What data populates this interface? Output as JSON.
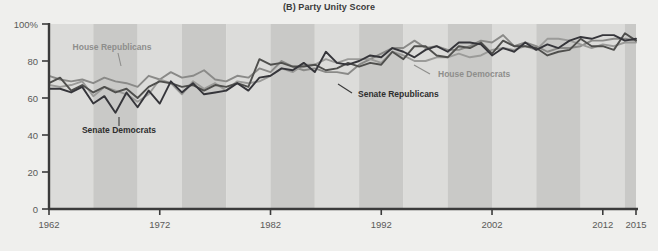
{
  "chart": {
    "title": "(B) Party Unity Score",
    "background_color": "#efefed",
    "band_color_light": "#dcdcda",
    "band_color_dark": "#c9c9c7",
    "axis_color": "#3b3b3b"
  },
  "axes": {
    "y_ticks": [
      "100%",
      "80",
      "60",
      "40",
      "20",
      "0"
    ],
    "y_values": [
      100,
      80,
      60,
      40,
      20,
      0
    ],
    "x_ticks": [
      "1962",
      "1972",
      "1982",
      "1992",
      "2002",
      "2012",
      "2015"
    ],
    "x_values": [
      1962,
      1972,
      1982,
      1992,
      2002,
      2012,
      2015
    ]
  },
  "annotations": [
    {
      "id": "house-republicans",
      "text": "House Republicans",
      "style": "light",
      "x": 112,
      "y": 50,
      "anchor": "middle",
      "leader": {
        "x1": 118,
        "y1": 53,
        "x2": 121,
        "y2": 66
      }
    },
    {
      "id": "senate-democrats",
      "text": "Senate Democrats",
      "style": "dark",
      "x": 119,
      "y": 133,
      "anchor": "middle",
      "leader": {
        "x1": 119,
        "y1": 117,
        "x2": 119,
        "y2": 126
      }
    },
    {
      "id": "house-democrats",
      "text": "House Democrats",
      "style": "light",
      "x": 438,
      "y": 77,
      "anchor": "start",
      "leader": {
        "x1": 430,
        "y1": 74,
        "x2": 414,
        "y2": 65
      }
    },
    {
      "id": "senate-republicans",
      "text": "Senate Republicans",
      "style": "dark",
      "x": 358,
      "y": 97,
      "anchor": "start",
      "leader": {
        "x1": 352,
        "y1": 93,
        "x2": 338,
        "y2": 84
      }
    }
  ],
  "chart_data": {
    "type": "line",
    "title": "(B) Party Unity Score",
    "xlabel": "",
    "ylabel": "",
    "xlim": [
      1962,
      2015
    ],
    "ylim": [
      0,
      100
    ],
    "grid": false,
    "legend": "inline-annotations",
    "x": [
      1962,
      1963,
      1964,
      1965,
      1966,
      1967,
      1968,
      1969,
      1970,
      1971,
      1972,
      1973,
      1974,
      1975,
      1976,
      1977,
      1978,
      1979,
      1980,
      1981,
      1982,
      1983,
      1984,
      1985,
      1986,
      1987,
      1988,
      1989,
      1990,
      1991,
      1992,
      1993,
      1994,
      1995,
      1996,
      1997,
      1998,
      1999,
      2000,
      2001,
      2002,
      2003,
      2004,
      2005,
      2006,
      2007,
      2008,
      2009,
      2010,
      2011,
      2012,
      2013,
      2014,
      2015
    ],
    "series": [
      {
        "name": "House Republicans",
        "color": "#8a8a88",
        "values": [
          72,
          70,
          69,
          70,
          68,
          71,
          69,
          68,
          66,
          72,
          70,
          74,
          71,
          72,
          75,
          70,
          69,
          72,
          71,
          76,
          74,
          80,
          77,
          75,
          76,
          74,
          74,
          73,
          78,
          81,
          84,
          87,
          87,
          91,
          87,
          88,
          86,
          86,
          88,
          91,
          90,
          94,
          88,
          90,
          88,
          85,
          87,
          87,
          88,
          91,
          91,
          92,
          92,
          91
        ]
      },
      {
        "name": "House Democrats",
        "color": "#9b9b99",
        "values": [
          67,
          66,
          67,
          69,
          61,
          66,
          64,
          62,
          58,
          62,
          70,
          68,
          62,
          69,
          65,
          68,
          64,
          69,
          68,
          69,
          72,
          76,
          74,
          78,
          78,
          81,
          79,
          81,
          81,
          81,
          79,
          85,
          83,
          80,
          80,
          82,
          82,
          84,
          82,
          83,
          86,
          87,
          86,
          88,
          86,
          92,
          92,
          91,
          89,
          87,
          89,
          88,
          90,
          90
        ]
      },
      {
        "name": "Senate Republicans",
        "color": "#4f4f4d",
        "values": [
          68,
          71,
          64,
          67,
          63,
          66,
          63,
          65,
          60,
          66,
          69,
          68,
          66,
          67,
          64,
          67,
          66,
          68,
          66,
          81,
          78,
          79,
          77,
          77,
          78,
          75,
          76,
          79,
          77,
          79,
          78,
          85,
          81,
          88,
          88,
          83,
          82,
          88,
          87,
          90,
          84,
          91,
          88,
          88,
          87,
          83,
          85,
          86,
          92,
          88,
          88,
          86,
          95,
          91
        ]
      },
      {
        "name": "Senate Democrats",
        "color": "#35353a",
        "values": [
          65,
          65,
          63,
          66,
          57,
          61,
          52,
          63,
          55,
          64,
          57,
          69,
          63,
          68,
          62,
          63,
          64,
          68,
          64,
          71,
          72,
          76,
          75,
          79,
          74,
          85,
          79,
          78,
          80,
          83,
          82,
          87,
          85,
          82,
          86,
          88,
          85,
          90,
          90,
          89,
          83,
          87,
          85,
          90,
          86,
          89,
          87,
          91,
          93,
          92,
          94,
          94,
          91,
          92
        ]
      }
    ]
  }
}
